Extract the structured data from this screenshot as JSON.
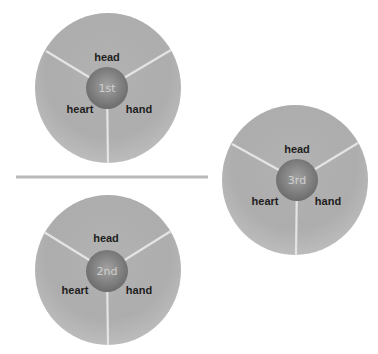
{
  "diagram": {
    "title": "",
    "colors": {
      "disc_light": "#bdbdbd",
      "disc_dark": "#a6a6a6",
      "hub_light": "#a2a2a2",
      "hub_dark": "#6c6c6c",
      "divider": "#e4e4e4",
      "separator": "#bababa"
    },
    "separator": {
      "x1": 16,
      "y1": 177,
      "x2": 208,
      "y2": 177
    },
    "wheels": [
      {
        "id": "first",
        "hub_label": "1st",
        "cx": 108,
        "cy": 88,
        "rx": 73,
        "ry": 75,
        "hub": {
          "cx": 107,
          "cy": 88,
          "r": 21
        },
        "segments": [
          {
            "label": "head",
            "x": 107,
            "y": 61
          },
          {
            "label": "heart",
            "x": 80,
            "y": 113
          },
          {
            "label": "hand",
            "x": 139,
            "y": 113
          }
        ],
        "dividers": [
          {
            "x": 46,
            "y": 51
          },
          {
            "x": 171,
            "y": 50
          },
          {
            "x": 108,
            "y": 163
          }
        ]
      },
      {
        "id": "second",
        "hub_label": "2nd",
        "cx": 108,
        "cy": 270,
        "rx": 73,
        "ry": 75,
        "hub": {
          "cx": 107,
          "cy": 271,
          "r": 21
        },
        "segments": [
          {
            "label": "head",
            "x": 106,
            "y": 242
          },
          {
            "label": "heart",
            "x": 75,
            "y": 294
          },
          {
            "label": "hand",
            "x": 139,
            "y": 294
          }
        ],
        "dividers": [
          {
            "x": 44,
            "y": 232
          },
          {
            "x": 171,
            "y": 231
          },
          {
            "x": 108,
            "y": 345
          }
        ]
      },
      {
        "id": "third",
        "hub_label": "3rd",
        "cx": 295,
        "cy": 180,
        "rx": 73,
        "ry": 75,
        "hub": {
          "cx": 297,
          "cy": 180,
          "r": 21
        },
        "segments": [
          {
            "label": "head",
            "x": 297,
            "y": 153
          },
          {
            "label": "heart",
            "x": 265,
            "y": 205
          },
          {
            "label": "hand",
            "x": 328,
            "y": 205
          }
        ],
        "dividers": [
          {
            "x": 232,
            "y": 144
          },
          {
            "x": 358,
            "y": 143
          },
          {
            "x": 296,
            "y": 255
          }
        ]
      }
    ]
  }
}
